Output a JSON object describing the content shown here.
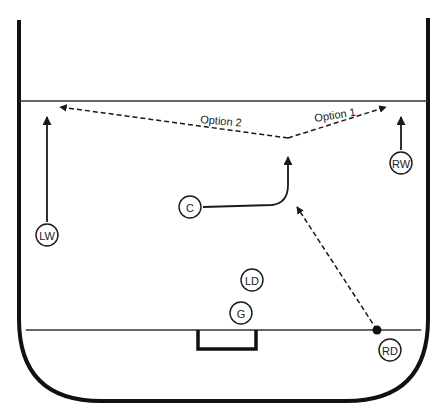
{
  "diagram": {
    "title": "",
    "colors": {
      "line": "#1a1a1a",
      "boards": "#111111",
      "background": "#ffffff"
    },
    "rink": {
      "left_board_x": 19,
      "right_board_x": 428,
      "top_y": 18,
      "bottom_y": 401,
      "corner_radius": 82,
      "top_line_y": 101,
      "goal_line_y": 330,
      "goal": {
        "x1": 198,
        "x2": 256,
        "y1": 330,
        "y2": 349
      }
    },
    "players": [
      {
        "id": "LW",
        "label": "LW",
        "x": 47,
        "y": 235
      },
      {
        "id": "RW",
        "label": "RW",
        "x": 401,
        "y": 163
      },
      {
        "id": "C",
        "label": "C",
        "x": 190,
        "y": 207
      },
      {
        "id": "LD",
        "label": "LD",
        "x": 252,
        "y": 280
      },
      {
        "id": "G",
        "label": "G",
        "x": 241,
        "y": 313
      },
      {
        "id": "RD",
        "label": "RD",
        "x": 390,
        "y": 350
      }
    ],
    "puck": {
      "x": 377,
      "y": 330
    },
    "options": [
      {
        "label": "Option 2",
        "x": 200,
        "y": 123,
        "rotate": 5
      },
      {
        "label": "Option 1",
        "x": 315,
        "y": 122,
        "rotate": -9
      }
    ],
    "movements": [
      {
        "from": "LW",
        "type": "skate",
        "path": "M47,222 L47,117"
      },
      {
        "from": "RW",
        "type": "skate",
        "path": "M401,150 L401,117"
      },
      {
        "from": "C",
        "type": "skate",
        "path": "M203,207 L272,205 Q288,203 288,185 L288,157"
      }
    ],
    "passes": [
      {
        "type": "pass",
        "path": "M377,330 L297,207"
      },
      {
        "type": "pass",
        "name": "option-2",
        "path": "M288,138 L60,107"
      },
      {
        "type": "pass",
        "name": "option-1",
        "path": "M288,138 L386,107"
      }
    ]
  }
}
